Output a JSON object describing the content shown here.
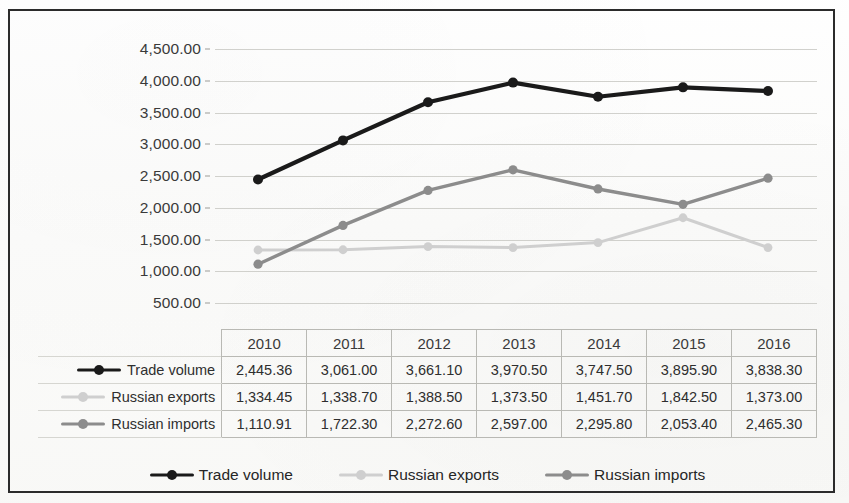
{
  "chart_data": {
    "type": "line",
    "title": "",
    "xlabel": "",
    "ylabel": "",
    "categories": [
      "2010",
      "2011",
      "2012",
      "2013",
      "2014",
      "2015",
      "2016"
    ],
    "ylim": [
      0,
      4500
    ],
    "y_ticks": [
      "500.00",
      "1,000.00",
      "1,500.00",
      "2,000.00",
      "2,500.00",
      "3,000.00",
      "3,500.00",
      "4,000.00",
      "4,500.00"
    ],
    "y_tick_values": [
      500,
      1000,
      1500,
      2000,
      2500,
      3000,
      3500,
      4000,
      4500
    ],
    "grid": true,
    "legend_position": "bottom",
    "series": [
      {
        "name": "Trade volume",
        "color": "#1a1a1a",
        "values": [
          2445.36,
          3061.0,
          3661.1,
          3970.5,
          3747.5,
          3895.9,
          3838.3
        ],
        "labels": [
          "2,445.36",
          "3,061.00",
          "3,661.10",
          "3,970.50",
          "3,747.50",
          "3,895.90",
          "3,838.30"
        ]
      },
      {
        "name": "Russian exports",
        "color": "#cfcfcf",
        "values": [
          1334.45,
          1338.7,
          1388.5,
          1373.5,
          1451.7,
          1842.5,
          1373.0
        ],
        "labels": [
          "1,334.45",
          "1,338.70",
          "1,388.50",
          "1,373.50",
          "1,451.70",
          "1,842.50",
          "1,373.00"
        ]
      },
      {
        "name": "Russian imports",
        "color": "#8c8c8c",
        "values": [
          1110.91,
          1722.3,
          2272.6,
          2597.0,
          2295.8,
          2053.4,
          2465.3
        ],
        "labels": [
          "1,110.91",
          "1,722.30",
          "2,272.60",
          "2,597.00",
          "2,295.80",
          "2,053.40",
          "2,465.30"
        ]
      }
    ]
  },
  "table": {
    "corner_label": "",
    "column_headers": [
      "2010",
      "2011",
      "2012",
      "2013",
      "2014",
      "2015",
      "2016"
    ],
    "rows": [
      {
        "label": "Trade volume",
        "color": "#1a1a1a",
        "values": [
          "2,445.36",
          "3,061.00",
          "3,661.10",
          "3,970.50",
          "3,747.50",
          "3,895.90",
          "3,838.30"
        ]
      },
      {
        "label": "Russian exports",
        "color": "#cfcfcf",
        "values": [
          "1,334.45",
          "1,338.70",
          "1,388.50",
          "1,373.50",
          "1,451.70",
          "1,842.50",
          "1,373.00"
        ]
      },
      {
        "label": "Russian imports",
        "color": "#8c8c8c",
        "values": [
          "1,110.91",
          "1,722.30",
          "2,272.60",
          "2,597.00",
          "2,295.80",
          "2,053.40",
          "2,465.30"
        ]
      }
    ]
  },
  "legend": {
    "items": [
      {
        "label": "Trade volume",
        "color": "#1a1a1a"
      },
      {
        "label": "Russian exports",
        "color": "#cfcfcf"
      },
      {
        "label": "Russian imports",
        "color": "#8c8c8c"
      }
    ]
  }
}
